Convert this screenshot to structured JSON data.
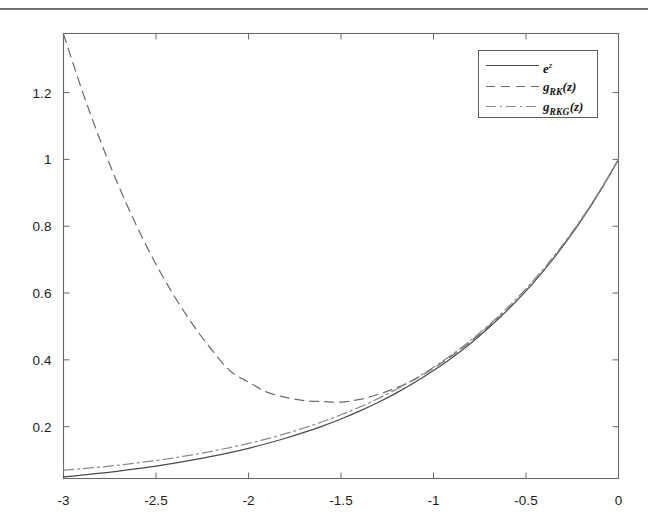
{
  "page": {
    "rule_color": "#3b3b3b",
    "background": "#ffffff"
  },
  "figure": {
    "axis_color": "#6a6a6a",
    "text_color": "#1d1d1d"
  },
  "legend": {
    "position": "top-right",
    "entries": [
      {
        "label_html": "e",
        "sup": "z",
        "name": "exp",
        "style": "solid"
      },
      {
        "label_html": "g",
        "sub": "RK",
        "paren": "(z)",
        "name": "g_RK",
        "style": "dashed"
      },
      {
        "label_html": "g",
        "sub": "RKG",
        "paren": "(z)",
        "name": "g_RKG",
        "style": "dashdot"
      }
    ]
  },
  "chart_data": {
    "type": "line",
    "title": "",
    "xlabel": "",
    "ylabel": "",
    "xlim": [
      -3.0,
      0.0
    ],
    "ylim": [
      0.0449,
      1.3768
    ],
    "grid": false,
    "legend_position": "upper right",
    "xticks": [
      -3,
      -2.5,
      -2,
      -1.5,
      -1,
      -0.5,
      0
    ],
    "xticklabels": [
      "-3",
      "-2.5",
      "-2",
      "-1.5",
      "-1",
      "-0.5",
      "0"
    ],
    "yticks": [
      0.2,
      0.4,
      0.6,
      0.8,
      1,
      1.2
    ],
    "yticklabels": [
      "0.2",
      "0.4",
      "0.6",
      "0.8",
      "1",
      "1.2"
    ],
    "x": [
      -3.0,
      -2.9,
      -2.8,
      -2.7,
      -2.6,
      -2.5,
      -2.4,
      -2.3,
      -2.2,
      -2.1,
      -2.0,
      -1.9,
      -1.8,
      -1.7,
      -1.6,
      -1.5,
      -1.4,
      -1.3,
      -1.2,
      -1.1,
      -1.0,
      -0.9,
      -0.8,
      -0.7,
      -0.6,
      -0.5,
      -0.4,
      -0.3,
      -0.2,
      -0.1,
      0.0
    ],
    "series": [
      {
        "name": "e^z",
        "style": "solid",
        "color": "#4a4a4a",
        "values": [
          0.0498,
          0.055,
          0.0608,
          0.0672,
          0.0743,
          0.0821,
          0.0907,
          0.1003,
          0.1108,
          0.1225,
          0.1353,
          0.1496,
          0.1653,
          0.1827,
          0.2019,
          0.2231,
          0.2466,
          0.2725,
          0.3012,
          0.3329,
          0.3679,
          0.4066,
          0.4493,
          0.4966,
          0.5488,
          0.6065,
          0.6703,
          0.7408,
          0.8187,
          0.9048,
          1.0
        ]
      },
      {
        "name": "g_RK(z)",
        "style": "dashed",
        "color": "#6d6d6d",
        "values": [
          1.375,
          1.2071,
          1.055,
          0.918,
          0.7954,
          0.6862,
          0.5896,
          0.5048,
          0.431,
          0.3674,
          0.3333,
          0.3036,
          0.288,
          0.278,
          0.2752,
          0.2734,
          0.2816,
          0.2964,
          0.3166,
          0.3417,
          0.375,
          0.4126,
          0.4551,
          0.5013,
          0.5512,
          0.6068,
          0.6702,
          0.7407,
          0.8187,
          0.9048,
          1.0
        ]
      },
      {
        "name": "g_RKG(z)",
        "style": "dashdot",
        "color": "#8a8a8a",
        "values": [
          0.07,
          0.0742,
          0.0792,
          0.085,
          0.0915,
          0.0988,
          0.107,
          0.1161,
          0.1262,
          0.1375,
          0.1499,
          0.1637,
          0.179,
          0.196,
          0.2148,
          0.2356,
          0.2586,
          0.284,
          0.3122,
          0.3434,
          0.3779,
          0.416,
          0.4581,
          0.5047,
          0.5562,
          0.6131,
          0.676,
          0.7455,
          0.8223,
          0.9072,
          1.0
        ]
      }
    ]
  }
}
